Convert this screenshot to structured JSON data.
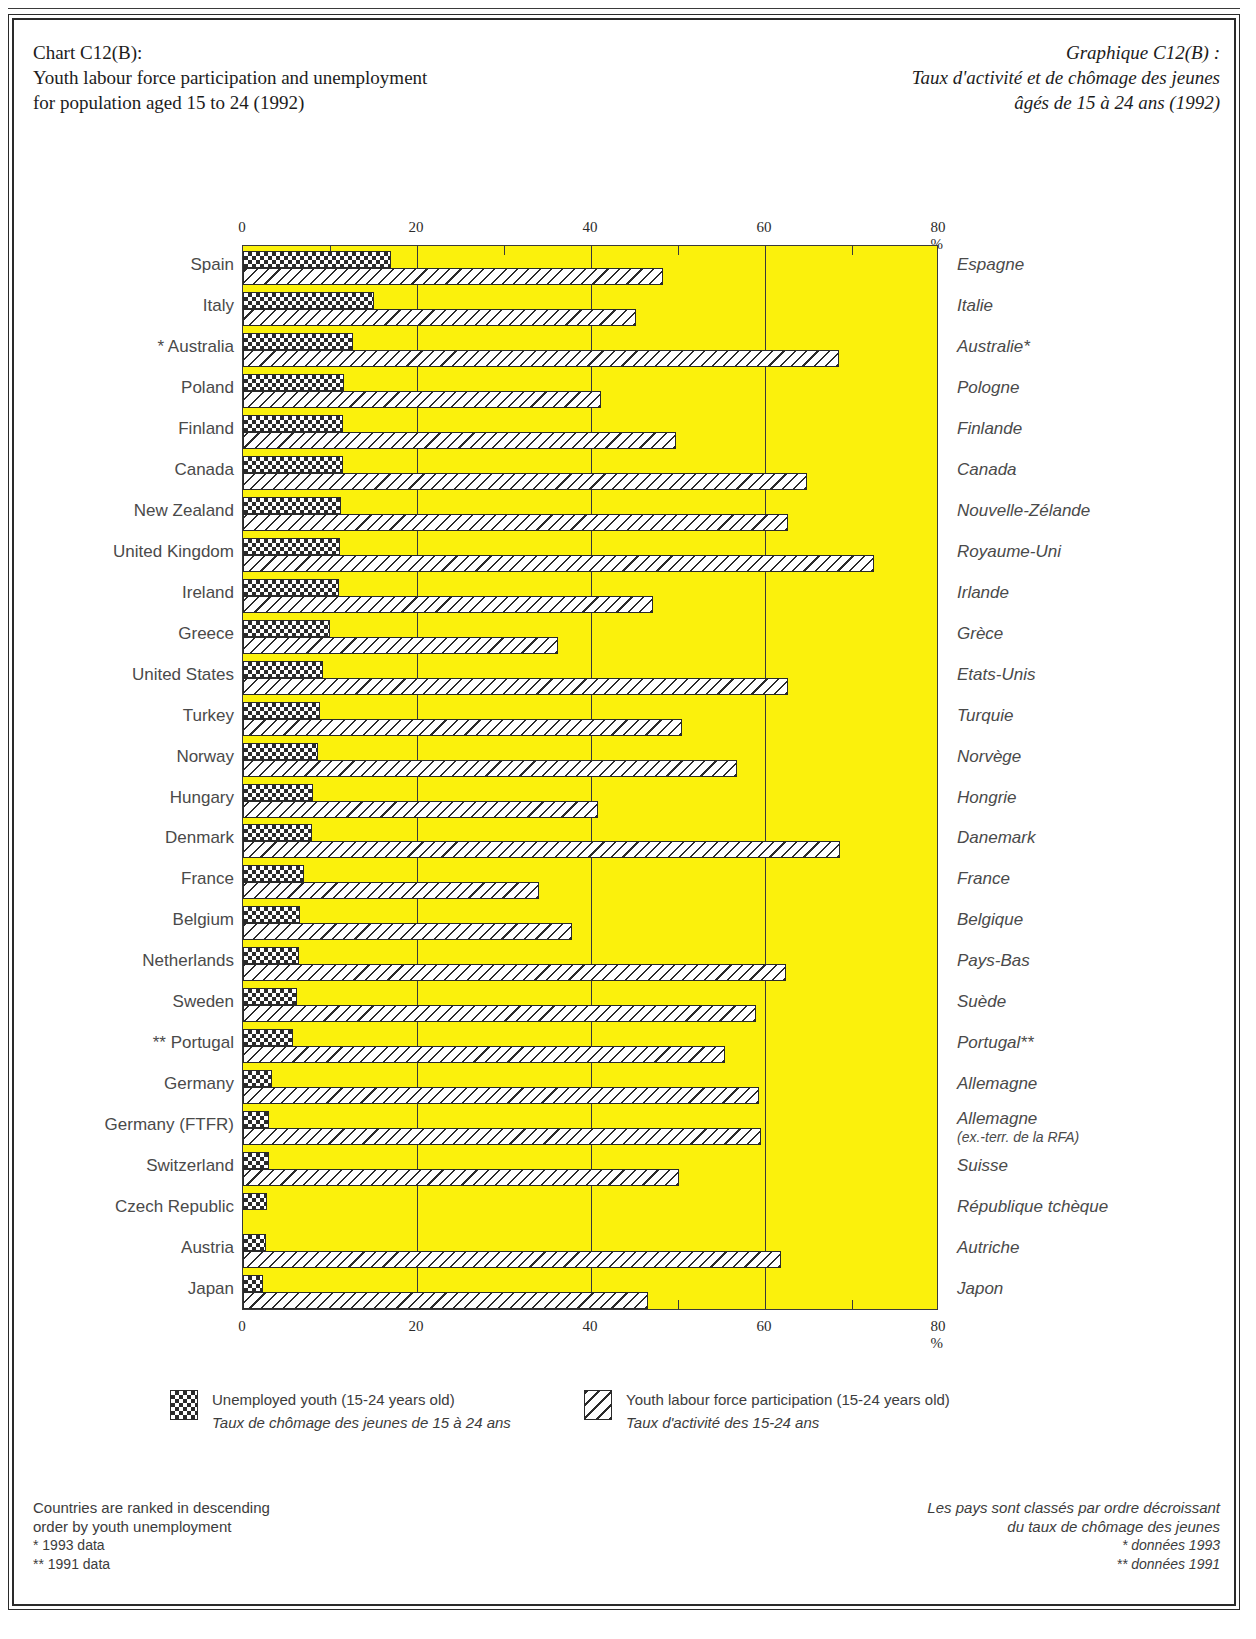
{
  "title_en": [
    "Chart C12(B):",
    "Youth labour force participation and unemployment",
    "for population aged 15 to 24 (1992)"
  ],
  "title_fr": [
    "Graphique C12(B) :",
    "Taux d'activité et de chômage des jeunes",
    "âgés de 15 à 24 ans (1992)"
  ],
  "axis": {
    "ticks": [
      "0",
      "20",
      "40",
      "60",
      "80 %"
    ],
    "tick_values": [
      0,
      20,
      40,
      60,
      80
    ]
  },
  "legend": {
    "unemployed": {
      "en": "Unemployed youth (15-24 years old)",
      "fr": "Taux de chômage des jeunes de 15 à 24 ans",
      "swatch": "checkerboard-swatch"
    },
    "participation": {
      "en": "Youth labour force participation (15-24 years old)",
      "fr": "Taux d'activité des 15-24 ans",
      "swatch": "diagonal-hatch-swatch"
    }
  },
  "footnotes": {
    "en": [
      "Countries are ranked in descending",
      "order by youth unemployment",
      "*  1993 data",
      "** 1991 data"
    ],
    "fr": [
      "Les pays sont classés par ordre décroissant",
      "du taux de chômage des jeunes",
      "*  données 1993",
      "** données 1991"
    ]
  },
  "chart_data": {
    "type": "bar",
    "orientation": "horizontal",
    "title": "Youth labour force participation and unemployment for population aged 15 to 24 (1992)",
    "xlabel": "%",
    "ylabel": "",
    "xlim": [
      0,
      80
    ],
    "grid": true,
    "legend_position": "bottom",
    "categories": [
      "Spain",
      "Italy",
      "* Australia",
      "Poland",
      "Finland",
      "Canada",
      "New Zealand",
      "United Kingdom",
      "Ireland",
      "Greece",
      "United States",
      "Turkey",
      "Norway",
      "Hungary",
      "Denmark",
      "France",
      "Belgium",
      "Netherlands",
      "Sweden",
      "** Portugal",
      "Germany",
      "Germany (FTFR)",
      "Switzerland",
      "Czech Republic",
      "Austria",
      "Japan"
    ],
    "categories_fr": [
      "Espagne",
      "Italie",
      "Australie*",
      "Pologne",
      "Finlande",
      "Canada",
      "Nouvelle-Zélande",
      "Royaume-Uni",
      "Irlande",
      "Grèce",
      "Etats-Unis",
      "Turquie",
      "Norvège",
      "Hongrie",
      "Danemark",
      "France",
      "Belgique",
      "Pays-Bas",
      "Suède",
      "Portugal**",
      "Allemagne",
      "Allemagne",
      "Suisse",
      "République tchèque",
      "Autriche",
      "Japon"
    ],
    "categories_fr_sub": [
      "",
      "",
      "",
      "",
      "",
      "",
      "",
      "",
      "",
      "",
      "",
      "",
      "",
      "",
      "",
      "",
      "",
      "",
      "",
      "",
      "",
      "(ex.-terr. de la RFA)",
      "",
      "",
      "",
      ""
    ],
    "series": [
      {
        "name": "Unemployed youth (15-24 years old)",
        "name_fr": "Taux de chômage des jeunes de 15 à 24 ans",
        "values": [
          17.0,
          15.0,
          12.7,
          11.6,
          11.5,
          11.5,
          11.3,
          11.2,
          11.0,
          10.0,
          9.2,
          8.9,
          8.6,
          8.0,
          7.9,
          7.0,
          6.6,
          6.4,
          6.2,
          5.8,
          3.3,
          3.0,
          3.0,
          2.8,
          2.6,
          2.3
        ]
      },
      {
        "name": "Youth labour force participation (15-24 years old)",
        "name_fr": "Taux d'activité des 15-24 ans",
        "values": [
          48.3,
          45.2,
          68.5,
          41.2,
          49.8,
          64.8,
          62.6,
          72.5,
          47.1,
          36.2,
          62.6,
          50.5,
          56.8,
          40.8,
          68.6,
          34.0,
          37.8,
          62.4,
          59.0,
          55.4,
          59.3,
          59.5,
          50.1,
          0.0,
          61.8,
          46.5
        ]
      }
    ]
  }
}
